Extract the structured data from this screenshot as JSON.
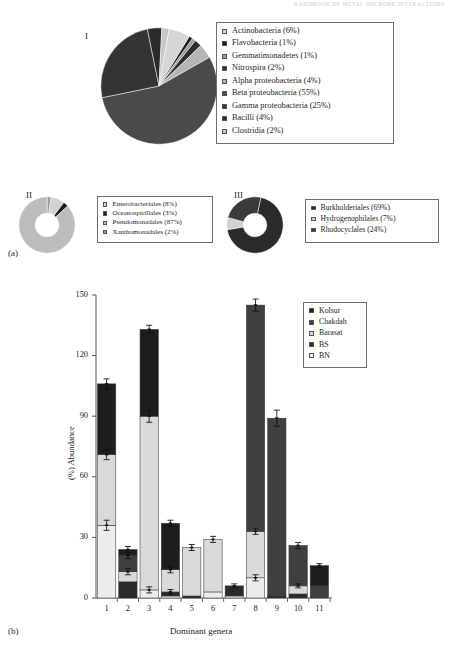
{
  "running_head": "HANDBOOK OF METAL-MICROBE INTERACTIONS",
  "panels": {
    "a_label": "(a)",
    "b_label": "(b)"
  },
  "pie_I": {
    "roman": "I",
    "legend": [
      {
        "label": "Actinobacteria (6%)",
        "value": 6,
        "color": "#d6d6d6"
      },
      {
        "label": "Flavobacteria (1%)",
        "value": 1,
        "color": "#1a1a1a"
      },
      {
        "label": "Gemmatimonadetes (1%)",
        "value": 1,
        "color": "#9a9a9a"
      },
      {
        "label": "Nitrospira (2%)",
        "value": 2,
        "color": "#2e2e2e"
      },
      {
        "label": "Alpha proteobacteria (4%)",
        "value": 4,
        "color": "#b5b5b5"
      },
      {
        "label": "Beta proteobacteria (55%)",
        "value": 55,
        "color": "#4a4a4a"
      },
      {
        "label": "Gamma proteobacteria (25%)",
        "value": 25,
        "color": "#343434"
      },
      {
        "label": "Bacilli (4%)",
        "value": 4,
        "color": "#2a2a2a"
      },
      {
        "label": "Clostridia (2%)",
        "value": 2,
        "color": "#c8c8c8"
      }
    ]
  },
  "pie_II": {
    "roman": "II",
    "legend": [
      {
        "label": "Enterobacteriales (8%)",
        "value": 8,
        "color": "#d2d2d2"
      },
      {
        "label": "Oceanospirillales (3%)",
        "value": 3,
        "color": "#1e1e1e"
      },
      {
        "label": "Pseudomonadales (87%)",
        "value": 87,
        "color": "#bcbcbc"
      },
      {
        "label": "Xanthomonadales (2%)",
        "value": 2,
        "color": "#9a9a9a"
      }
    ]
  },
  "pie_III": {
    "roman": "III",
    "legend": [
      {
        "label": "Burkholderiales (69%)",
        "value": 69,
        "color": "#2b2b2b"
      },
      {
        "label": "Hydrogenophilales (7%)",
        "value": 7,
        "color": "#d0d0d0"
      },
      {
        "label": "Rhodocyclales (24%)",
        "value": 24,
        "color": "#3a3a3a"
      }
    ]
  },
  "chart_data": {
    "type": "bar",
    "stacked": true,
    "title": "",
    "xlabel": "Dominant genera",
    "ylabel": "(%) Abundance",
    "ylim": [
      0,
      150
    ],
    "yticks": [
      0,
      30,
      60,
      90,
      120,
      150
    ],
    "grid": false,
    "legend_position": "top-right",
    "categories": [
      "1",
      "2",
      "3",
      "4",
      "5",
      "6",
      "7",
      "8",
      "9",
      "10",
      "11"
    ],
    "series": [
      {
        "name": "Kolsur",
        "color": "#1d1d1d",
        "values": [
          35,
          3,
          43,
          23,
          0,
          0,
          0,
          0,
          0,
          0,
          10
        ]
      },
      {
        "name": "Chakdah",
        "color": "#3f3f3f",
        "values": [
          0,
          8,
          0,
          0,
          0,
          0,
          0,
          112,
          88,
          20,
          6
        ]
      },
      {
        "name": "Barasat",
        "color": "#d9d9d9",
        "values": [
          35,
          5,
          86,
          11,
          24,
          26,
          0,
          23,
          0,
          4,
          0
        ]
      },
      {
        "name": "BS",
        "color": "#2a2a2a",
        "values": [
          0,
          8,
          0,
          2,
          1,
          0,
          5,
          0,
          1,
          2,
          0
        ]
      },
      {
        "name": "BN",
        "color": "#ececec",
        "values": [
          36,
          0,
          4,
          1,
          0,
          3,
          1,
          10,
          0,
          0,
          0
        ]
      }
    ],
    "errors": [
      {
        "category": "1",
        "tops": [
          36,
          71,
          106
        ],
        "err": [
          2.5,
          2.5,
          2.5
        ]
      },
      {
        "category": "2",
        "tops": [
          13,
          21,
          24
        ],
        "err": [
          1.5,
          1.5,
          1.5
        ]
      },
      {
        "category": "3",
        "tops": [
          4,
          90,
          133
        ],
        "err": [
          1.5,
          3.0,
          2.0
        ]
      },
      {
        "category": "4",
        "tops": [
          3,
          14,
          37
        ],
        "err": [
          1.2,
          1.5,
          1.5
        ]
      },
      {
        "category": "5",
        "tops": [
          25
        ],
        "err": [
          1.5
        ]
      },
      {
        "category": "6",
        "tops": [
          29
        ],
        "err": [
          1.5
        ]
      },
      {
        "category": "7",
        "tops": [
          6
        ],
        "err": [
          1.0
        ]
      },
      {
        "category": "8",
        "tops": [
          10,
          33,
          145
        ],
        "err": [
          1.5,
          1.5,
          3.0
        ]
      },
      {
        "category": "9",
        "tops": [
          89
        ],
        "err": [
          4.0
        ]
      },
      {
        "category": "10",
        "tops": [
          6,
          26
        ],
        "err": [
          1.0,
          1.5
        ]
      },
      {
        "category": "11",
        "tops": [
          16
        ],
        "err": [
          1.0
        ]
      }
    ]
  },
  "chart_legend": {
    "entries": [
      {
        "label": "Kolsur",
        "color": "#1d1d1d"
      },
      {
        "label": "Chakdah",
        "color": "#3f3f3f"
      },
      {
        "label": "Barasat",
        "color": "#d9d9d9"
      },
      {
        "label": "BS",
        "color": "#2a2a2a"
      },
      {
        "label": "BN",
        "color": "#ececec"
      }
    ]
  }
}
